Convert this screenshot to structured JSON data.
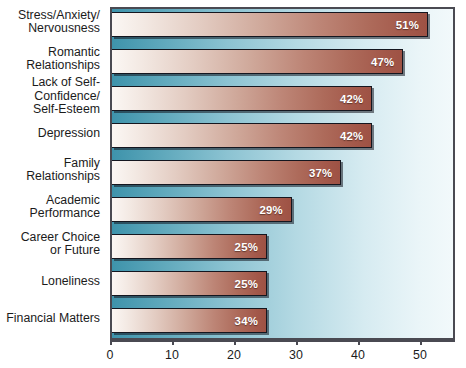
{
  "chart_data": {
    "type": "bar",
    "orientation": "horizontal",
    "title": "",
    "subtitle": "",
    "xlabel": "",
    "ylabel": "",
    "grid": false,
    "legend": null,
    "xlim": [
      0,
      55.6
    ],
    "xticks": [
      0,
      10,
      20,
      30,
      40,
      50
    ],
    "xtick_labels": [
      "0",
      "10",
      "20",
      "30",
      "40",
      "50"
    ],
    "categories": [
      "Stress/Anxiety/\nNervousness",
      "Romantic\nRelationships",
      "Lack of Self-\nConfidence/\nSelf-Esteem",
      "Depression",
      "Family\nRelationships",
      "Academic\nPerformance",
      "Career Choice\nor Future",
      "Loneliness",
      "Financial Matters"
    ],
    "values": [
      51,
      47,
      42,
      42,
      37,
      29,
      25,
      25,
      34
    ],
    "data_labels": [
      "51%",
      "47%",
      "42%",
      "42%",
      "37%",
      "29%",
      "25%",
      "25%",
      "34%"
    ],
    "drawn_lengths": [
      51,
      47,
      42,
      42,
      37,
      29,
      25,
      25,
      25
    ],
    "colors": {
      "bar_gradient_start": "#fbf7f4",
      "bar_gradient_end": "#9e5244",
      "bar_border": "#14161f",
      "plot_background_left": "#3e93ab",
      "plot_background_right": "#f2f9fb",
      "frame": "#4a4a52",
      "label_text": "#1b1b1b",
      "value_text": "#ffffff"
    }
  },
  "axis_geometry": {
    "plot_left_px": 110,
    "plot_top_px": 7,
    "plot_width_px": 345,
    "plot_height_px": 333,
    "px_per_unit": 6.2,
    "bar_height_px": 25,
    "row_pitch_px": 37
  }
}
